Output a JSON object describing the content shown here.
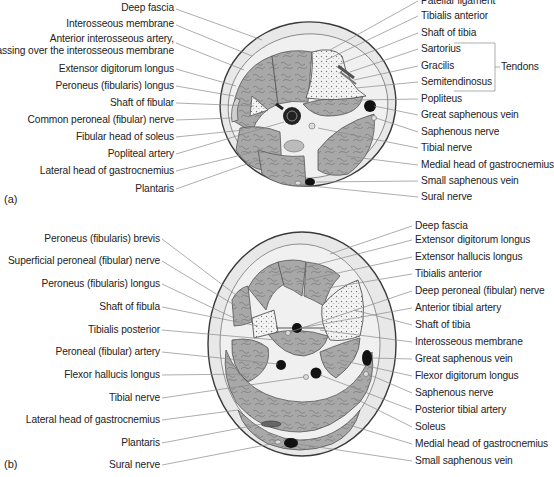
{
  "figure": {
    "panels": [
      {
        "tag": "(a)",
        "left_labels": [
          {
            "text": "Deep fascia",
            "y": 8
          },
          {
            "text": "Interosseous membrane",
            "y": 24
          },
          {
            "text": "Anterior interosseous artery,",
            "y": 39
          },
          {
            "text": "passing over the interosseous membrane",
            "y": 51
          },
          {
            "text": "Extensor digitorum longus",
            "y": 68
          },
          {
            "text": "Peroneus (fibularis) longus",
            "y": 85
          },
          {
            "text": "Shaft of fibular",
            "y": 102
          },
          {
            "text": "Common peroneal (fibular) nerve",
            "y": 119
          },
          {
            "text": "Fibular head of soleus",
            "y": 136
          },
          {
            "text": "Popliteal artery",
            "y": 153
          },
          {
            "text": "Lateral head of gastrocnemius",
            "y": 170
          },
          {
            "text": "Plantaris",
            "y": 188
          }
        ],
        "right_labels": [
          {
            "text": "Patellar ligament",
            "y": 0
          },
          {
            "text": "Tibialis anterior",
            "y": 15
          },
          {
            "text": "Shaft of tibia",
            "y": 32
          },
          {
            "text": "Sartorius",
            "y": 48
          },
          {
            "text": "Gracilis",
            "y": 65
          },
          {
            "text": "Semitendinosus",
            "y": 81
          },
          {
            "text": "Popliteus",
            "y": 98
          },
          {
            "text": "Great saphenous vein",
            "y": 114
          },
          {
            "text": "Saphenous nerve",
            "y": 131
          },
          {
            "text": "Tibial nerve",
            "y": 147
          },
          {
            "text": "Medial head of gastrocnemius",
            "y": 164
          },
          {
            "text": "Small saphenous vein",
            "y": 180
          },
          {
            "text": "Sural nerve",
            "y": 196
          }
        ],
        "bracket_label": "Tendons"
      },
      {
        "tag": "(b)",
        "left_labels": [
          {
            "text": "Peroneus (fibularis) brevis",
            "y": 237
          },
          {
            "text": "Superficial peroneal (fibular) nerve",
            "y": 259
          },
          {
            "text": "Peroneus (fibularis) longus",
            "y": 282
          },
          {
            "text": "Shaft of fibula",
            "y": 305
          },
          {
            "text": "Tibialis posterior",
            "y": 328
          },
          {
            "text": "Peroneal (fibular) artery",
            "y": 351
          },
          {
            "text": "Flexor hallucis longus",
            "y": 373
          },
          {
            "text": "Tibial nerve",
            "y": 396
          },
          {
            "text": "Lateral head of gastrocnemius",
            "y": 418
          },
          {
            "text": "Plantaris",
            "y": 441
          },
          {
            "text": "Sural nerve",
            "y": 463
          }
        ],
        "right_labels": [
          {
            "text": "Deep fascia",
            "y": 224
          },
          {
            "text": "Extensor digitorum longus",
            "y": 237
          },
          {
            "text": "Extensor hallucis longus",
            "y": 254
          },
          {
            "text": "Tibialis anterior",
            "y": 271
          },
          {
            "text": "Deep peroneal (fibular) nerve",
            "y": 288
          },
          {
            "text": "Anterior tibial artery",
            "y": 305
          },
          {
            "text": "Shaft of tibia",
            "y": 322
          },
          {
            "text": "Interosseous membrane",
            "y": 340
          },
          {
            "text": "Great saphenous vein",
            "y": 357
          },
          {
            "text": "Flexor digitorum longus",
            "y": 374
          },
          {
            "text": "Saphenous nerve",
            "y": 391
          },
          {
            "text": "Posterior tibial artery",
            "y": 408
          },
          {
            "text": "Soleus",
            "y": 425
          },
          {
            "text": "Medial head of gastrocnemius",
            "y": 442
          },
          {
            "text": "Small saphenous vein",
            "y": 459
          }
        ]
      }
    ],
    "colors": {
      "skin": "#e9e9e9",
      "muscle": "#a9a9a9",
      "bone": "#f2f2f2",
      "vessel": "#1a1a1a",
      "outline": "#4a4a4a",
      "leader": "#8a8a8a"
    }
  }
}
